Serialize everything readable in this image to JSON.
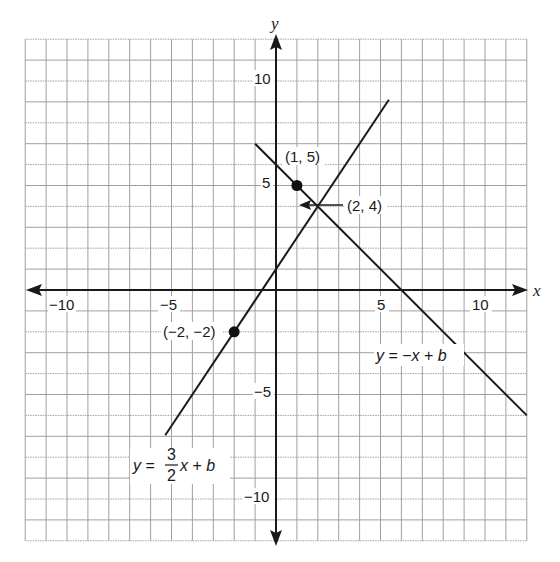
{
  "chart_data": {
    "type": "line",
    "title": "",
    "xlabel": "x",
    "ylabel": "y",
    "xlim": [
      -12,
      12
    ],
    "ylim": [
      -12,
      12
    ],
    "grid": true,
    "grid_step": 1,
    "x_ticks": [
      {
        "value": -10,
        "label": "−10"
      },
      {
        "value": -5,
        "label": "−5"
      },
      {
        "value": 5,
        "label": "5"
      },
      {
        "value": 10,
        "label": "10"
      }
    ],
    "y_ticks": [
      {
        "value": 10,
        "label": "10"
      },
      {
        "value": 5,
        "label": "5"
      },
      {
        "value": -5,
        "label": "−5"
      },
      {
        "value": -10,
        "label": "−10"
      }
    ],
    "series": [
      {
        "name": "y = 3/2 x + b",
        "label_parts": {
          "lhs": "y",
          "eq": " = ",
          "num": "3",
          "den": "2",
          "rhs_var": "x",
          "rhs": " + ",
          "b": "b"
        },
        "slope": 1.5,
        "intercept": 1,
        "x": [
          -5.3,
          5.4
        ],
        "y": [
          -6.95,
          9.1
        ]
      },
      {
        "name": "y = −x + b",
        "label_parts": {
          "lhs": "y",
          "eq": " = −",
          "rhs_var": "x",
          "rhs": " + ",
          "b": "b"
        },
        "slope": -1,
        "intercept": 6,
        "x": [
          -1,
          12
        ],
        "y": [
          7,
          -6
        ]
      }
    ],
    "points": [
      {
        "x": 1,
        "y": 5,
        "label": "(1, 5)",
        "marker": true
      },
      {
        "x": -2,
        "y": -2,
        "label": "(−2, −2)",
        "marker": true
      },
      {
        "x": 2,
        "y": 4,
        "label": "(2, 4)",
        "marker": false,
        "arrow": true
      }
    ],
    "colors": {
      "grid": "#a0a0a0",
      "axis": "#1a1a1a",
      "line": "#1a1a1a",
      "point": "#111111"
    }
  }
}
